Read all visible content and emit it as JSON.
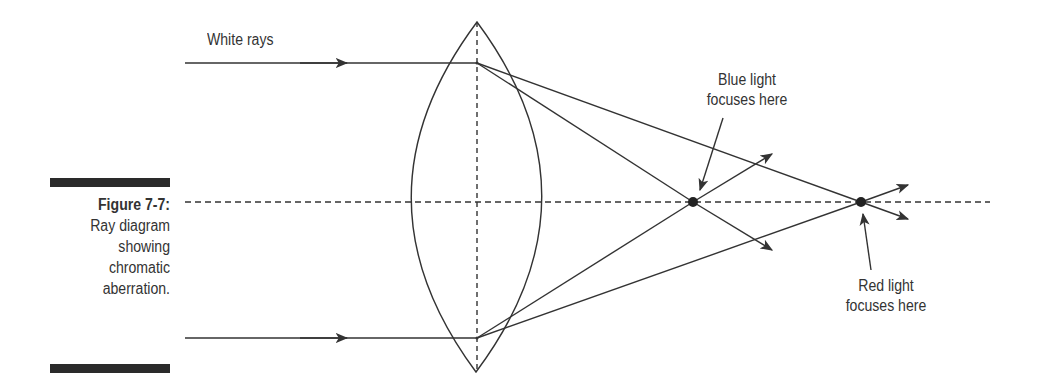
{
  "caption": {
    "figure_label": "Figure 7-7:",
    "description_lines": [
      "Ray diagram",
      "showing",
      "chromatic",
      "aberration."
    ]
  },
  "labels": {
    "white_rays": "White rays",
    "blue_focus_line1": "Blue light",
    "blue_focus_line2": "focuses here",
    "red_focus_line1": "Red light",
    "red_focus_line2": "focuses here"
  },
  "colors": {
    "line": "#333333",
    "bar": "#2a2a2a",
    "background": "#ffffff"
  }
}
